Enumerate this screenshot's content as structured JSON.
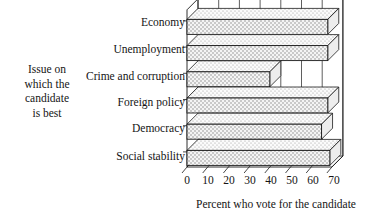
{
  "chart_data": {
    "type": "bar",
    "orientation": "horizontal",
    "style": "3d-stippled",
    "title": "",
    "xlabel": "Percent who vote for the candidate",
    "ylabel": "Issue on which the candidate is best",
    "categories": [
      "Economy",
      "Unemployment",
      "Crime and corruption",
      "Foreign policy",
      "Democracy",
      "Social stability"
    ],
    "values": [
      68,
      68,
      40,
      68,
      65,
      69
    ],
    "xlim": [
      0,
      70
    ],
    "xticks": [
      0,
      10,
      20,
      30,
      40,
      50,
      60,
      70
    ],
    "xtick_labels": [
      "0",
      "10",
      "20",
      "30",
      "40",
      "50",
      "60",
      "70"
    ],
    "grid": true,
    "legend": null,
    "series": [
      {
        "name": "Percent who vote for the candidate",
        "values": [
          68,
          68,
          40,
          68,
          65,
          69
        ]
      }
    ]
  },
  "axis": {
    "y_title_lines": [
      "Issue on",
      "which the",
      "candidate",
      "is best"
    ],
    "x_title": "Percent who vote for the candidate"
  },
  "colors": {
    "line": "#1a1a1a",
    "bar_fill": "#f2f2f2",
    "bar_top": "#e6e6e6",
    "bar_side": "#d9d9d9",
    "background": "#ffffff"
  }
}
